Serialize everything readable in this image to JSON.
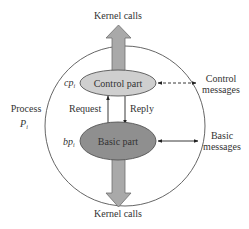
{
  "diagram": {
    "process_label": {
      "line1": "Process",
      "line2_main": "P",
      "line2_sub": "i"
    },
    "control_part": {
      "label": "Control part",
      "symbol_main": "cp",
      "symbol_sub": "i",
      "fill": "#cfcfcf"
    },
    "basic_part": {
      "label": "Basic part",
      "symbol_main": "bp",
      "symbol_sub": "i",
      "fill": "#8f8f8f"
    },
    "kernel_calls_top": "Kernel calls",
    "kernel_calls_bottom": "Kernel calls",
    "request_label": "Request",
    "reply_label": "Reply",
    "control_messages": {
      "line1": "Control",
      "line2": "messages",
      "style": "dashed"
    },
    "basic_messages": {
      "line1": "Basic",
      "line2": "messages",
      "style": "solid"
    },
    "colors": {
      "arrow_fill": "#a9a9a9",
      "arrow_stroke": "#6f6f6f",
      "circle_stroke": "#555555",
      "text": "#333333"
    }
  }
}
